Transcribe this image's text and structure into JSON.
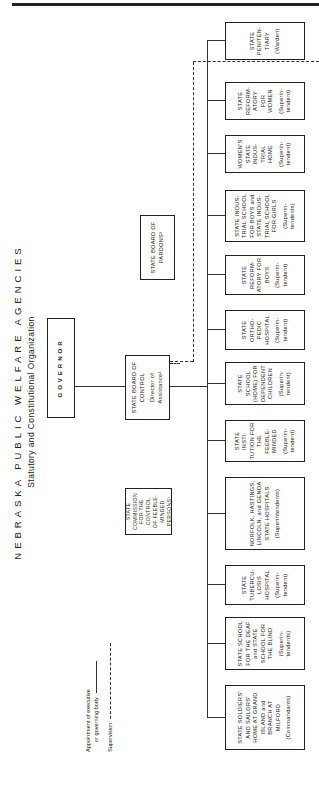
{
  "title": "NEBRASKA PUBLIC WELFARE AGENCIES",
  "subtitle": "Statutory and Constitutional Organization",
  "legend": {
    "appointment_line1": "Appointment of executive",
    "appointment_line2": "or governing body",
    "supervision": "Supervision"
  },
  "governor": "GOVERNOR",
  "board_of_control": {
    "name_line1": "STATE BOARD OF",
    "name_line2": "CONTROL",
    "sub_line1": "Director of",
    "sub_line2": "Assistance²"
  },
  "board_of_pardons": {
    "line1": "STATE BOARD OF",
    "line2": "PARDONS³"
  },
  "commission_feeble_minded": {
    "line1": "STATE COMMISSION",
    "line2": "FOR THE CONTROL",
    "line3": "OF FEEBLE-MINDED",
    "line4": "PERSONS¹"
  },
  "institutions": [
    {
      "name": "STATE PENITEN- TIARY",
      "head": "(Warden)"
    },
    {
      "name": "STATE REFORM- ATORY FOR WOMEN",
      "head": "(Superin- tendent)"
    },
    {
      "name": "WOMEN'S STATE INDUS- TRIAL HOME",
      "head": "(Superin- tendent)"
    },
    {
      "name": "STATE INDUS- TRIAL SCHOOL FOR BOYS and STATE INDUS- TRIAL SCHOOL FOR GIRLS",
      "head": "(Superin- tendents)"
    },
    {
      "name": "STATE REFORM- ATORY FOR BOYS",
      "head": "(Superin- tendent)"
    },
    {
      "name": "STATE ORTHO- PEDIC HOSPITAL",
      "head": "(Superin- tendent)"
    },
    {
      "name": "STATE SCHOOL (HOME) FOR DEPENDENT CHILDREN",
      "head": "(Superin- tendent)"
    },
    {
      "name": "STATE INSTI- TUTION FOR THE FEEBLE- MINDED",
      "head": "(Superin- tendent)"
    },
    {
      "name": "NORFOLK, HASTINGS, LINCOLN, and GENOA STATE HOSPITALS",
      "head": "(Superintendents)"
    },
    {
      "name": "STATE TUBERCU- LOSIS HOSPITAL",
      "head": "(Superin- tendent)"
    },
    {
      "name": "STATE SCHOOL FOR THE DEAF and STATE SCHOOL FOR THE BLIND",
      "head": "(Superin- tendents)"
    },
    {
      "name": "STATE SOLDIERS' AND SAILORS' HOME AT GRAND ISLAND and BRANCH AT MILFORD",
      "head": "(Commandants)"
    }
  ]
}
